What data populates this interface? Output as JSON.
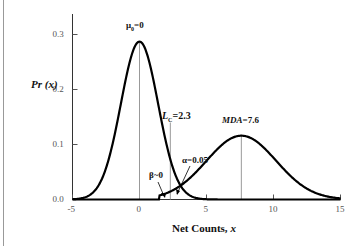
{
  "chart_data": {
    "type": "line",
    "title": "",
    "xlabel": "Net Counts, x",
    "ylabel": "Pr (x)",
    "xlim": [
      -5,
      15
    ],
    "ylim": [
      0,
      0.35
    ],
    "xticks": [
      "-5",
      "0",
      "5",
      "10",
      "15"
    ],
    "yticks": [
      "0.0",
      "0.1",
      "0.2",
      "0.3"
    ],
    "grid": false,
    "legend": null,
    "series": [
      {
        "name": "Background distribution (mean 0)",
        "mean": 0,
        "sigma": 1.39,
        "peak": 0.287
      },
      {
        "name": "Detection distribution (mean MDA)",
        "mean": 7.6,
        "sigma": 2.6,
        "peak": 0.116
      }
    ],
    "vertical_lines": [
      {
        "x": 0,
        "label": "μ0=0"
      },
      {
        "x": 2.3,
        "label": "LC=2.3"
      },
      {
        "x": 7.6,
        "label": "MDA=7.6"
      }
    ],
    "annotations": [
      {
        "text": "α=0.05",
        "points_to": "tail of background curve right of LC"
      },
      {
        "text": "β~0",
        "points_to": "tail of detection curve left of LC"
      }
    ]
  },
  "labels": {
    "ylabel_main": "Pr",
    "ylabel_arg": " (x)",
    "xlabel_main": "Net Counts, ",
    "xlabel_var": "x",
    "mu_label": "μ",
    "mu_sub": "0",
    "mu_value": "=0",
    "lc_label": "L",
    "lc_sub": "C",
    "lc_value": "=2.3",
    "mda_label": "MDA",
    "mda_value": "=7.6",
    "alpha_label": "α=0.05",
    "beta_label": "β~0"
  }
}
